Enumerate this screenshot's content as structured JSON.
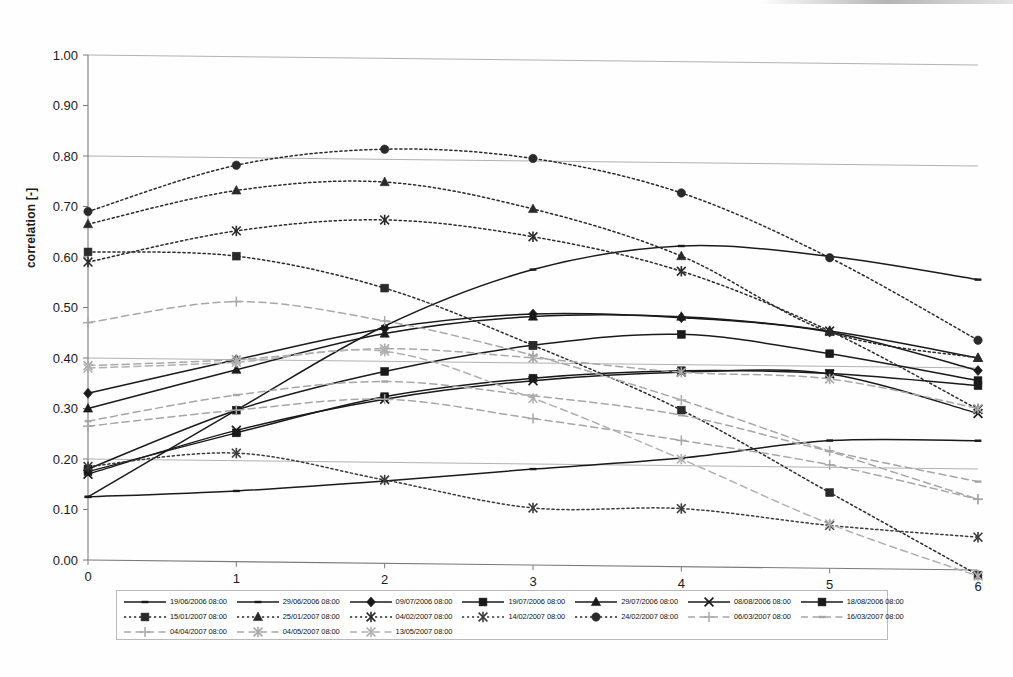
{
  "axes": {
    "ylabel": "correlation [-]",
    "xlabel": "",
    "y_ticks": [
      "0.00",
      "0.10",
      "0.20",
      "0.30",
      "0.40",
      "0.50",
      "0.60",
      "0.70",
      "0.80",
      "0.90",
      "1.00"
    ],
    "x_ticks": [
      "0",
      "1",
      "2",
      "3",
      "4",
      "5",
      "6"
    ]
  },
  "chart_data": {
    "type": "line",
    "title": "",
    "xlabel": "",
    "ylabel": "correlation [-]",
    "xlim": [
      0,
      6
    ],
    "ylim": [
      0.0,
      1.0
    ],
    "x": [
      0,
      1,
      2,
      3,
      4,
      5,
      6
    ],
    "grid": "horizontal gridlines at 0.20, 0.40, 0.80, 1.00",
    "legend_position": "bottom",
    "series": [
      {
        "name": "19/06/2006 08:00",
        "marker": "dash",
        "style": "solid",
        "color": "#1a1a1a",
        "values": [
          0.125,
          0.14,
          0.163,
          0.19,
          0.215,
          0.253,
          0.256
        ]
      },
      {
        "name": "29/06/2006 08:00",
        "marker": "dash",
        "style": "solid",
        "color": "#1a1a1a",
        "values": [
          0.125,
          0.3,
          0.47,
          0.585,
          0.635,
          0.618,
          0.575
        ]
      },
      {
        "name": "09/07/2006 08:00",
        "marker": "diamond",
        "style": "solid",
        "color": "#1a1a1a",
        "values": [
          0.33,
          0.4,
          0.465,
          0.497,
          0.493,
          0.468,
          0.395
        ]
      },
      {
        "name": "19/07/2006 08:00",
        "marker": "square",
        "style": "solid",
        "color": "#1a1a1a",
        "values": [
          0.18,
          0.3,
          0.38,
          0.435,
          0.46,
          0.425,
          0.375
        ]
      },
      {
        "name": "29/07/2006 08:00",
        "marker": "triangle",
        "style": "solid",
        "color": "#1a1a1a",
        "values": [
          0.3,
          0.38,
          0.455,
          0.492,
          0.495,
          0.47,
          0.42
        ]
      },
      {
        "name": "08/08/2006 08:00",
        "marker": "x",
        "style": "solid",
        "color": "#1a1a1a",
        "values": [
          0.17,
          0.26,
          0.325,
          0.365,
          0.385,
          0.385,
          0.31
        ]
      },
      {
        "name": "18/08/2006 08:00",
        "marker": "square",
        "style": "solid",
        "color": "#1a1a1a",
        "values": [
          0.175,
          0.255,
          0.33,
          0.37,
          0.388,
          0.386,
          0.365
        ]
      },
      {
        "name": "15/01/2007 08:00",
        "marker": "square",
        "style": "dotted",
        "color": "#2a2a2a",
        "values": [
          0.61,
          0.605,
          0.545,
          0.435,
          0.31,
          0.15,
          -0.01
        ]
      },
      {
        "name": "25/01/2007 08:00",
        "marker": "triangle",
        "style": "dotted",
        "color": "#2a2a2a",
        "values": [
          0.665,
          0.735,
          0.755,
          0.705,
          0.615,
          0.468,
          0.42
        ]
      },
      {
        "name": "04/02/2007 08:00",
        "marker": "asterisk",
        "style": "dotted",
        "color": "#2a2a2a",
        "values": [
          0.59,
          0.655,
          0.68,
          0.65,
          0.585,
          0.47,
          0.318
        ]
      },
      {
        "name": "14/02/2007 08:00",
        "marker": "asterisk",
        "style": "dotted",
        "color": "#3a3a3a",
        "values": [
          0.185,
          0.215,
          0.165,
          0.113,
          0.115,
          0.085,
          0.065
        ]
      },
      {
        "name": "24/02/2007 08:00",
        "marker": "circle",
        "style": "dotted",
        "color": "#2a2a2a",
        "values": [
          0.69,
          0.785,
          0.82,
          0.805,
          0.74,
          0.615,
          0.455
        ]
      },
      {
        "name": "06/03/2007 08:00",
        "marker": "plus",
        "style": "dashed",
        "color": "#a6a6a6",
        "values": [
          0.265,
          0.3,
          0.325,
          0.29,
          0.25,
          0.205,
          0.14
        ]
      },
      {
        "name": "16/03/2007 08:00",
        "marker": "dash",
        "style": "dashed",
        "color": "#a6a6a6",
        "values": [
          0.275,
          0.33,
          0.36,
          0.335,
          0.3,
          0.232,
          0.175
        ]
      },
      {
        "name": "04/04/2007 08:00",
        "marker": "plus",
        "style": "dashed",
        "color": "#a8a8a8",
        "values": [
          0.47,
          0.515,
          0.48,
          0.415,
          0.33,
          0.232,
          0.14
        ]
      },
      {
        "name": "04/05/2007 08:00",
        "marker": "asterisk",
        "style": "dashed",
        "color": "#a8a8a8",
        "values": [
          0.385,
          0.4,
          0.425,
          0.41,
          0.385,
          0.375,
          0.32
        ]
      },
      {
        "name": "13/05/2007 08:00",
        "marker": "asterisk",
        "style": "dashed",
        "color": "#b0b0b0",
        "values": [
          0.38,
          0.395,
          0.42,
          0.33,
          0.213,
          0.088,
          -0.012
        ]
      }
    ]
  },
  "legend": {
    "rows": [
      [
        {
          "label": "19/06/2006 08:00",
          "series": 0
        },
        {
          "label": "29/06/2006 08:00",
          "series": 1
        },
        {
          "label": "09/07/2006 08:00",
          "series": 2
        },
        {
          "label": "19/07/2006 08:00",
          "series": 3
        },
        {
          "label": "29/07/2006 08:00",
          "series": 4
        },
        {
          "label": "08/08/2006 08:00",
          "series": 5
        },
        {
          "label": "18/08/2006 08:00",
          "series": 6
        }
      ],
      [
        {
          "label": "15/01/2007 08:00",
          "series": 7
        },
        {
          "label": "25/01/2007 08:00",
          "series": 8
        },
        {
          "label": "04/02/2007 08:00",
          "series": 9
        },
        {
          "label": "14/02/2007 08:00",
          "series": 10
        },
        {
          "label": "24/02/2007 08:00",
          "series": 11
        },
        {
          "label": "06/03/2007 08:00",
          "series": 12
        },
        {
          "label": "16/03/2007 08:00",
          "series": 13
        }
      ],
      [
        {
          "label": "04/04/2007 08:00",
          "series": 14
        },
        {
          "label": "04/05/2007 08:00",
          "series": 15
        },
        {
          "label": "13/05/2007 08:00",
          "series": 16
        }
      ]
    ]
  }
}
